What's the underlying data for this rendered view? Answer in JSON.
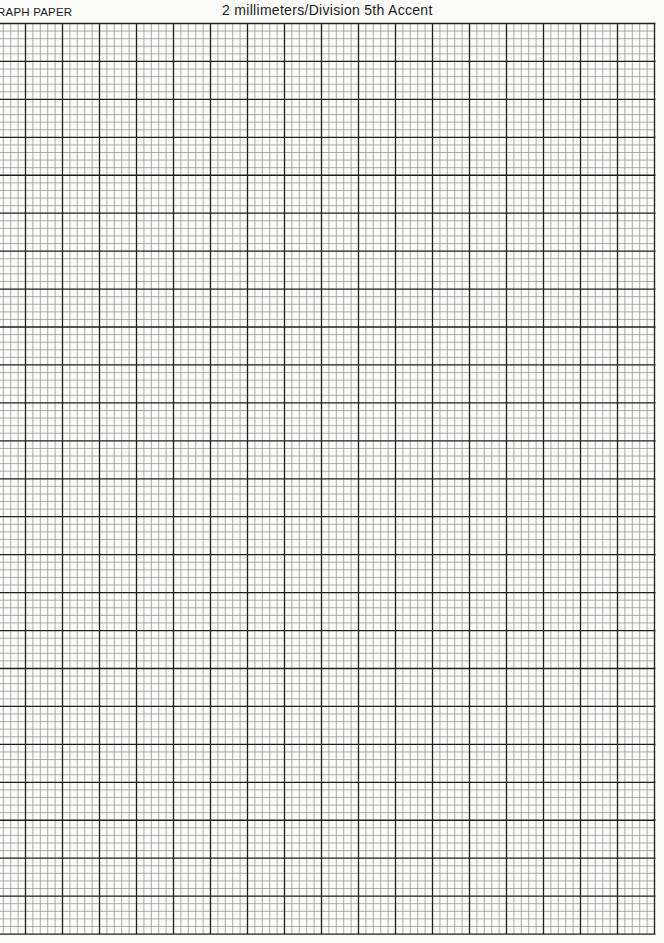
{
  "header": {
    "left_label": "RAPH PAPER",
    "title": "2 millimeters/Division 5th Accent"
  },
  "grid": {
    "top": 23.5,
    "bottom": 934,
    "left_clip": 0,
    "right": 655.5,
    "first_major_x": 25.5,
    "major_spacing_x": 37.0,
    "major_spacing_y": 37.94,
    "minor_per_major": 5,
    "major_count_x": 17,
    "major_count_y": 24,
    "colors": {
      "major": "#1e1e1e",
      "minor": "#8a8a8a",
      "paper": "#fbfbfa"
    }
  }
}
